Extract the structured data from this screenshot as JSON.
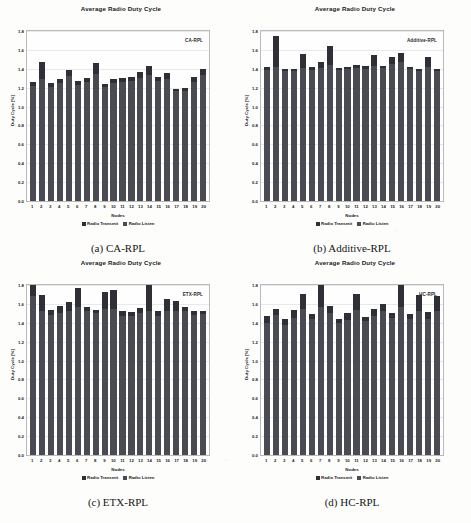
{
  "figure": {
    "panels": [
      {
        "key": "a",
        "caption": "(a) CA-RPL",
        "inplot_label": "CA-RPL",
        "chart_data": {
          "type": "bar",
          "title": "Average Radio Duty Cycle",
          "xlabel": "Nodes",
          "ylabel": "Duty Cycle [%]",
          "ylim": [
            0.0,
            1.8
          ],
          "yticks": [
            "0.0",
            "0.2",
            "0.4",
            "0.6",
            "0.8",
            "1.0",
            "1.2",
            "1.4",
            "1.6",
            "1.8"
          ],
          "grid": true,
          "stacked": true,
          "legend_position": "bottom-center",
          "categories": [
            "1",
            "2",
            "3",
            "4",
            "5",
            "6",
            "7",
            "8",
            "9",
            "10",
            "11",
            "12",
            "13",
            "14",
            "15",
            "16",
            "17",
            "18",
            "19",
            "20"
          ],
          "series": [
            {
              "name": "Radio Listen",
              "color": "#4a4a52",
              "values": [
                1.22,
                1.29,
                1.21,
                1.25,
                1.32,
                1.23,
                1.26,
                1.35,
                1.21,
                1.25,
                1.26,
                1.27,
                1.3,
                1.33,
                1.27,
                1.29,
                1.16,
                1.16,
                1.26,
                1.33
              ]
            },
            {
              "name": "Radio Transmit",
              "color": "#2f2f37",
              "values": [
                0.04,
                0.18,
                0.04,
                0.04,
                0.07,
                0.04,
                0.04,
                0.11,
                0.03,
                0.04,
                0.04,
                0.04,
                0.07,
                0.1,
                0.04,
                0.07,
                0.03,
                0.04,
                0.05,
                0.07
              ]
            }
          ],
          "totals": [
            1.26,
            1.47,
            1.25,
            1.29,
            1.39,
            1.27,
            1.3,
            1.46,
            1.24,
            1.29,
            1.3,
            1.31,
            1.37,
            1.43,
            1.31,
            1.36,
            1.19,
            1.2,
            1.31,
            1.4
          ]
        }
      },
      {
        "key": "b",
        "caption": "(b) Additive-RPL",
        "inplot_label": "Additive-RPL",
        "chart_data": {
          "type": "bar",
          "title": "Average Radio Duty Cycle",
          "xlabel": "Nodes",
          "ylabel": "Duty Cycle [%]",
          "ylim": [
            0.0,
            1.8
          ],
          "yticks": [
            "0.0",
            "0.2",
            "0.4",
            "0.6",
            "0.8",
            "1.0",
            "1.2",
            "1.4",
            "1.6",
            "1.8"
          ],
          "grid": true,
          "stacked": true,
          "legend_position": "bottom-center",
          "categories": [
            "1",
            "2",
            "3",
            "4",
            "5",
            "6",
            "7",
            "8",
            "9",
            "10",
            "11",
            "12",
            "13",
            "14",
            "15",
            "16",
            "17",
            "18",
            "19",
            "20"
          ],
          "series": [
            {
              "name": "Radio Listen",
              "color": "#4a4a52",
              "values": [
                1.39,
                1.42,
                1.38,
                1.38,
                1.41,
                1.39,
                1.41,
                1.44,
                1.39,
                1.4,
                1.41,
                1.4,
                1.43,
                1.41,
                1.45,
                1.47,
                1.4,
                1.38,
                1.42,
                1.38
              ]
            },
            {
              "name": "Radio Transmit",
              "color": "#2f2f37",
              "values": [
                0.03,
                0.33,
                0.02,
                0.02,
                0.15,
                0.03,
                0.06,
                0.2,
                0.02,
                0.02,
                0.03,
                0.03,
                0.12,
                0.02,
                0.08,
                0.1,
                0.02,
                0.02,
                0.1,
                0.02
              ]
            }
          ],
          "totals": [
            1.42,
            1.75,
            1.4,
            1.4,
            1.56,
            1.42,
            1.47,
            1.64,
            1.41,
            1.42,
            1.44,
            1.43,
            1.55,
            1.43,
            1.53,
            1.57,
            1.42,
            1.4,
            1.52,
            1.4
          ]
        }
      },
      {
        "key": "c",
        "caption": "(c) ETX-RPL",
        "inplot_label": "ETX-RPL",
        "chart_data": {
          "type": "bar",
          "title": "Average Radio Duty Cycle",
          "xlabel": "Nodes",
          "ylabel": "Duty Cycle [%]",
          "ylim": [
            0.0,
            1.8
          ],
          "yticks": [
            "0.0",
            "0.2",
            "0.4",
            "0.6",
            "0.8",
            "1.0",
            "1.2",
            "1.4",
            "1.6",
            "1.8"
          ],
          "grid": true,
          "stacked": true,
          "legend_position": "bottom-center",
          "categories": [
            "1",
            "2",
            "3",
            "4",
            "5",
            "6",
            "7",
            "8",
            "9",
            "10",
            "11",
            "12",
            "13",
            "14",
            "15",
            "16",
            "17",
            "18",
            "19",
            "20"
          ],
          "series": [
            {
              "name": "Radio Listen",
              "color": "#4a4a52",
              "values": [
                1.68,
                1.53,
                1.48,
                1.5,
                1.52,
                1.57,
                1.52,
                1.5,
                1.55,
                1.55,
                1.47,
                1.47,
                1.5,
                1.53,
                1.47,
                1.52,
                1.52,
                1.52,
                1.48,
                1.49
              ]
            },
            {
              "name": "Radio Transmit",
              "color": "#2f2f37",
              "values": [
                0.15,
                0.16,
                0.06,
                0.08,
                0.1,
                0.2,
                0.05,
                0.04,
                0.18,
                0.2,
                0.05,
                0.04,
                0.06,
                0.28,
                0.05,
                0.13,
                0.11,
                0.05,
                0.04,
                0.03
              ]
            }
          ],
          "totals": [
            1.83,
            1.69,
            1.54,
            1.58,
            1.62,
            1.77,
            1.57,
            1.54,
            1.73,
            1.75,
            1.52,
            1.51,
            1.56,
            1.81,
            1.52,
            1.65,
            1.63,
            1.57,
            1.52,
            1.52
          ]
        }
      },
      {
        "key": "d",
        "caption": "(d) HC-RPL",
        "inplot_label": "HC-RPL",
        "chart_data": {
          "type": "bar",
          "title": "Average Radio Duty Cycle",
          "xlabel": "Nodes",
          "ylabel": "Duty Cycle [%]",
          "ylim": [
            0.0,
            1.8
          ],
          "yticks": [
            "0.0",
            "0.2",
            "0.4",
            "0.6",
            "0.8",
            "1.0",
            "1.2",
            "1.4",
            "1.6",
            "1.8"
          ],
          "grid": true,
          "stacked": true,
          "legend_position": "bottom-center",
          "categories": [
            "1",
            "2",
            "3",
            "4",
            "5",
            "6",
            "7",
            "8",
            "9",
            "10",
            "11",
            "12",
            "13",
            "14",
            "15",
            "16",
            "17",
            "18",
            "19",
            "20"
          ],
          "series": [
            {
              "name": "Radio Listen",
              "color": "#4a4a52",
              "values": [
                1.4,
                1.48,
                1.38,
                1.45,
                1.55,
                1.44,
                1.57,
                1.5,
                1.4,
                1.43,
                1.54,
                1.42,
                1.47,
                1.52,
                1.45,
                1.57,
                1.44,
                1.52,
                1.44,
                1.53
              ]
            },
            {
              "name": "Radio Transmit",
              "color": "#2f2f37",
              "values": [
                0.07,
                0.07,
                0.06,
                0.09,
                0.16,
                0.05,
                0.25,
                0.08,
                0.04,
                0.07,
                0.17,
                0.04,
                0.08,
                0.08,
                0.05,
                0.25,
                0.05,
                0.17,
                0.07,
                0.15
              ]
            }
          ],
          "totals": [
            1.47,
            1.55,
            1.44,
            1.54,
            1.71,
            1.49,
            1.82,
            1.58,
            1.44,
            1.5,
            1.71,
            1.46,
            1.55,
            1.6,
            1.5,
            1.82,
            1.49,
            1.69,
            1.51,
            1.68
          ]
        }
      }
    ]
  }
}
